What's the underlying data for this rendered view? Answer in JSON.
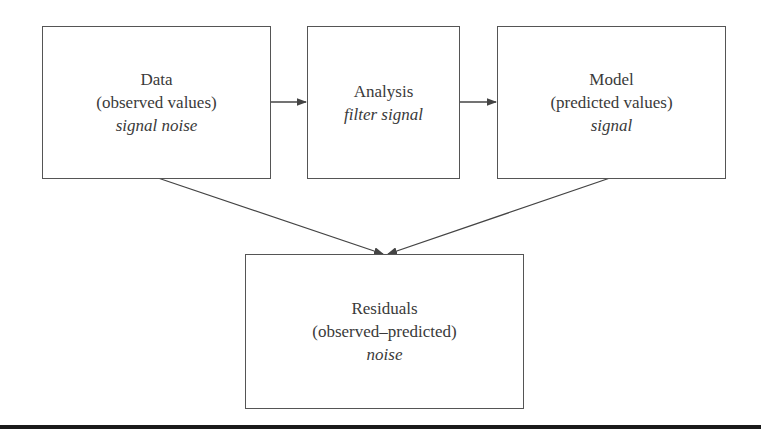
{
  "diagram": {
    "nodes": [
      {
        "id": "data",
        "title": "Data",
        "subtitle": "(observed values)",
        "note": "signal noise"
      },
      {
        "id": "analysis",
        "title": "Analysis",
        "note": "filter signal"
      },
      {
        "id": "model",
        "title": "Model",
        "subtitle": "(predicted values)",
        "note": "signal"
      },
      {
        "id": "residuals",
        "title": "Residuals",
        "subtitle": "(observed–predicted)",
        "note": "noise"
      }
    ],
    "edges": [
      {
        "from": "data",
        "to": "analysis"
      },
      {
        "from": "analysis",
        "to": "model"
      },
      {
        "from": "data",
        "to": "residuals"
      },
      {
        "from": "model",
        "to": "residuals"
      }
    ]
  }
}
